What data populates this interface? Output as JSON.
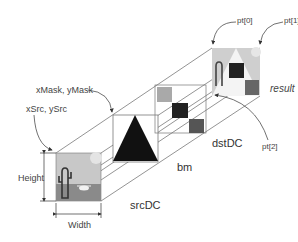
{
  "diagram": {
    "labels": {
      "mask_origin": "xMask, yMask",
      "src_origin": "xSrc, ySrc",
      "height": "Height",
      "width": "Width",
      "src_dc": "srcDC",
      "bitmap_mask": "bm",
      "dst_dc": "dstDC",
      "pt0": "pt[0]",
      "pt1": "pt[1]",
      "pt2": "pt[2]",
      "result": "result"
    },
    "colors": {
      "line": "#555555",
      "mask_triangle": "#111111",
      "checker_light": "#a9a9a9",
      "checker_dark": "#222222",
      "checker_mid": "#555555",
      "desert_sky": "#c8c8c8",
      "desert_ground": "#8a8a8a"
    },
    "nodes": [
      "srcDC",
      "bm",
      "dstDC",
      "result"
    ]
  }
}
